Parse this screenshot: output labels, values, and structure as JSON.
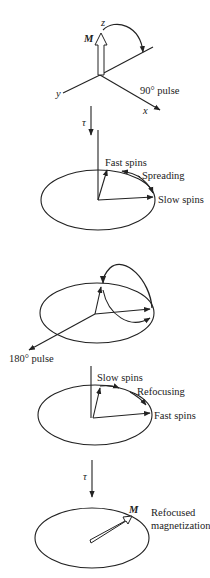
{
  "panels": [
    {
      "id": "initial",
      "labels": {
        "z_axis": "z",
        "y_axis": "y",
        "x_axis": "x",
        "magnetization": "M",
        "pulse": "90° pulse"
      }
    },
    {
      "id": "dephasing",
      "delay": "τ",
      "labels": {
        "fast": "Fast spins",
        "spreading": "Spreading",
        "slow": "Slow spins"
      }
    },
    {
      "id": "inversion",
      "labels": {
        "pulse": "180° pulse"
      }
    },
    {
      "id": "refocusing",
      "labels": {
        "slow": "Slow spins",
        "refocusing": "Refocusing",
        "fast": "Fast spins"
      }
    },
    {
      "id": "echo",
      "delay": "τ",
      "labels": {
        "magnetization": "M",
        "refocused_line1": "Refocused",
        "refocused_line2": "magnetization"
      }
    }
  ],
  "colors": {
    "ink": "#222222",
    "background": "#ffffff"
  }
}
